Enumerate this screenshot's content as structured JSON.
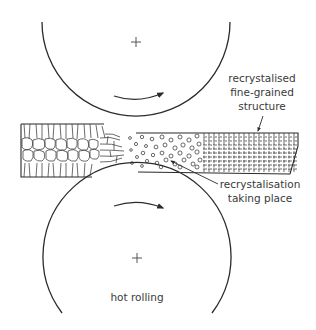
{
  "diagram": {
    "title": "hot rolling",
    "labels": {
      "recrystalised": [
        "recrystalised",
        "fine-grained",
        "structure"
      ],
      "recrystalisation": [
        "recrystalisation",
        "taking place"
      ],
      "caption": "hot rolling"
    },
    "components": [
      {
        "name": "top-roller",
        "center": "+",
        "rotation": "clockwise"
      },
      {
        "name": "bottom-roller",
        "center": "+",
        "rotation": "clockwise"
      },
      {
        "name": "metal-strip",
        "zones": [
          "coarse columnar grains",
          "deformed grains",
          "recrystalisation taking place",
          "recrystalised fine-grained structure"
        ]
      }
    ],
    "colors": {
      "line": "#2b2b2b",
      "text": "#3a3a3a"
    }
  }
}
